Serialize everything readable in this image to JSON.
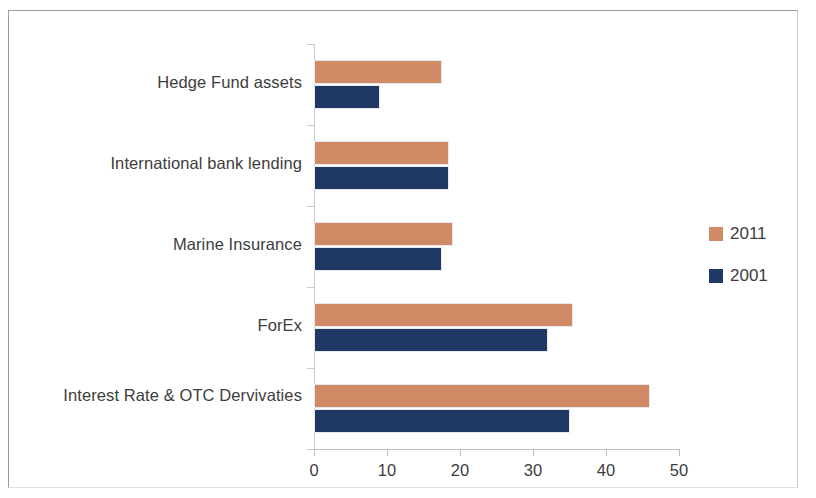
{
  "chart_data": {
    "type": "bar",
    "orientation": "horizontal",
    "title": "",
    "xlabel": "",
    "ylabel": "",
    "xlim": [
      0,
      50
    ],
    "xticks": [
      0,
      10,
      20,
      30,
      40,
      50
    ],
    "xtick_labels": [
      "0",
      "10",
      "20",
      "30",
      "40",
      "50"
    ],
    "grid": false,
    "legend_position": "right",
    "categories": [
      "Hedge Fund assets",
      "International bank lending",
      "Marine Insurance",
      "ForEx",
      "Interest Rate & OTC Dervivaties"
    ],
    "series": [
      {
        "name": "2011",
        "color": "#d08a66",
        "values": [
          17.5,
          18.5,
          19,
          35.5,
          46
        ]
      },
      {
        "name": "2001",
        "color": "#1f3864",
        "values": [
          9,
          18.5,
          17.5,
          32,
          35
        ]
      }
    ]
  },
  "legend": {
    "entries": [
      {
        "label": "2011",
        "color": "#d08a66"
      },
      {
        "label": "2001",
        "color": "#1f3864"
      }
    ]
  },
  "colors": {
    "series_2011": "#d08a66",
    "series_2001": "#1f3864",
    "axis": "#b9c0c7",
    "text": "#3d3d3d",
    "frame": "#9b9b9b"
  }
}
